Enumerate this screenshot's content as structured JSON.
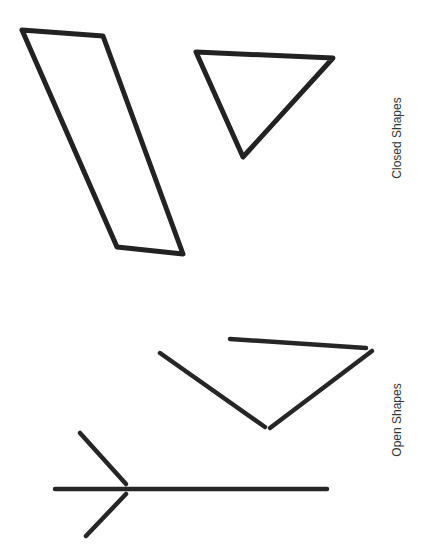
{
  "labels": {
    "closed": "Closed Shapes",
    "open": "Open Shapes"
  },
  "colors": {
    "background": "#ffffff",
    "stroke": "#222222",
    "text": "#333333"
  },
  "shapes": {
    "closed": [
      {
        "name": "parallelogram",
        "points": [
          [
            22,
            30
          ],
          [
            103,
            36
          ],
          [
            183,
            254
          ],
          [
            117,
            247
          ]
        ]
      },
      {
        "name": "triangle",
        "points": [
          [
            196,
            52
          ],
          [
            333,
            58
          ],
          [
            243,
            157
          ]
        ]
      }
    ],
    "open": [
      {
        "name": "open-v-shape",
        "segments": [
          [
            [
              160,
              353
            ],
            [
              265,
              427
            ]
          ],
          [
            [
              270,
              428
            ],
            [
              372,
              351
            ]
          ],
          [
            [
              230,
              339
            ],
            [
              366,
              348
            ]
          ]
        ]
      },
      {
        "name": "open-arrow-shape",
        "segments": [
          [
            [
              55,
              489
            ],
            [
              327,
              489
            ]
          ],
          [
            [
              80,
              433
            ],
            [
              126,
              484
            ]
          ],
          [
            [
              126,
              494
            ],
            [
              86,
              536
            ]
          ]
        ]
      }
    ]
  }
}
